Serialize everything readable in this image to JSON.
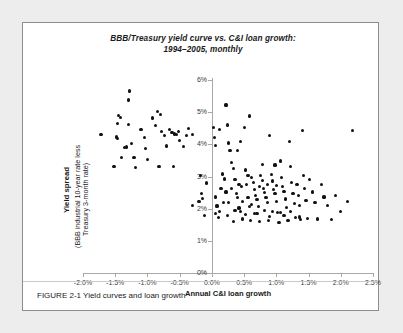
{
  "figure": {
    "caption": "FIGURE 2-1 Yield curves and loan growth"
  },
  "chart_data": {
    "type": "scatter",
    "title": "BBB/Treasury yield curve vs. C&I loan growth:",
    "subtitle": "1994–2005, monthly",
    "xlabel": "Annual C&I loan growth",
    "ylabel_main": "Yield spread",
    "ylabel_sub_line1": "(BBB industrial 10-year rate less",
    "ylabel_sub_line2": "Treasury 3-month rate)",
    "xlim": [
      -2.0,
      2.5
    ],
    "ylim": [
      0,
      6
    ],
    "xticks": [
      -2.0,
      -1.5,
      -1.0,
      -0.5,
      0.0,
      0.5,
      1.0,
      1.5,
      2.0,
      2.5
    ],
    "xticklabels": [
      "-2.0%",
      "-1.5%",
      "-1.0%",
      "-0.5%",
      "0.0%",
      "0.5%",
      "1.0%",
      "1.5%",
      "2.0%",
      "2.5%"
    ],
    "yticks": [
      0,
      1,
      2,
      3,
      4,
      5,
      6
    ],
    "yticklabels": [
      "0%",
      "1%",
      "2%",
      "3%",
      "4%",
      "5%",
      "6%"
    ],
    "grid": false,
    "legend": null,
    "marker_color": "#111111",
    "axis_color": "#a8a8a8",
    "y_axis_position": "x=0.0%",
    "points": [
      [
        -1.72,
        4.3
      ],
      [
        -1.28,
        5.66
      ],
      [
        -1.3,
        5.38
      ],
      [
        -1.45,
        4.9
      ],
      [
        -1.42,
        4.84
      ],
      [
        -1.47,
        4.65
      ],
      [
        -1.3,
        4.62
      ],
      [
        -1.48,
        4.23
      ],
      [
        -1.46,
        4.18
      ],
      [
        -1.35,
        3.9
      ],
      [
        -1.4,
        3.58
      ],
      [
        -1.33,
        3.92
      ],
      [
        -1.25,
        4.02
      ],
      [
        -1.21,
        3.6
      ],
      [
        -1.52,
        3.32
      ],
      [
        -1.1,
        4.47
      ],
      [
        -1.05,
        4.2
      ],
      [
        -1.03,
        3.88
      ],
      [
        -1.0,
        3.54
      ],
      [
        -0.92,
        4.82
      ],
      [
        -0.88,
        4.58
      ],
      [
        -0.85,
        5.02
      ],
      [
        -0.8,
        4.92
      ],
      [
        -0.78,
        4.4
      ],
      [
        -0.74,
        4.27
      ],
      [
        -0.7,
        3.95
      ],
      [
        -0.66,
        4.46
      ],
      [
        -0.62,
        4.38
      ],
      [
        -0.58,
        4.32
      ],
      [
        -0.55,
        4.3
      ],
      [
        -0.52,
        4.4
      ],
      [
        -0.5,
        4.12
      ],
      [
        -0.6,
        3.3
      ],
      [
        -0.82,
        3.3
      ],
      [
        -1.18,
        3.28
      ],
      [
        -0.44,
        3.94
      ],
      [
        -0.4,
        4.28
      ],
      [
        -0.36,
        4.5
      ],
      [
        -0.3,
        4.3
      ],
      [
        -0.18,
        3.02
      ],
      [
        -0.16,
        2.46
      ],
      [
        -0.2,
        2.22
      ],
      [
        -0.3,
        2.1
      ],
      [
        -0.14,
        2.32
      ],
      [
        -0.12,
        1.78
      ],
      [
        -0.08,
        2.8
      ],
      [
        0.02,
        4.52
      ],
      [
        0.04,
        4.22
      ],
      [
        0.06,
        3.96
      ],
      [
        0.05,
        2.36
      ],
      [
        0.08,
        2.08
      ],
      [
        0.1,
        1.72
      ],
      [
        0.12,
        4.45
      ],
      [
        0.14,
        2.62
      ],
      [
        0.18,
        2.2
      ],
      [
        0.22,
        5.22
      ],
      [
        0.24,
        4.6
      ],
      [
        0.26,
        4.04
      ],
      [
        0.28,
        3.82
      ],
      [
        0.3,
        3.44
      ],
      [
        0.2,
        2.92
      ],
      [
        0.22,
        2.52
      ],
      [
        0.26,
        2.18
      ],
      [
        0.34,
        1.6
      ],
      [
        0.36,
        2.9
      ],
      [
        0.38,
        2.46
      ],
      [
        0.4,
        2.34
      ],
      [
        0.42,
        2.02
      ],
      [
        0.46,
        2.68
      ],
      [
        0.48,
        1.68
      ],
      [
        0.5,
        4.52
      ],
      [
        0.52,
        3.2
      ],
      [
        0.54,
        2.74
      ],
      [
        0.56,
        2.34
      ],
      [
        0.58,
        2.06
      ],
      [
        0.6,
        1.62
      ],
      [
        0.62,
        2.98
      ],
      [
        0.64,
        2.82
      ],
      [
        0.66,
        2.6
      ],
      [
        0.68,
        2.42
      ],
      [
        0.7,
        2.28
      ],
      [
        0.72,
        2.06
      ],
      [
        0.74,
        1.6
      ],
      [
        0.76,
        3.02
      ],
      [
        0.78,
        2.88
      ],
      [
        0.8,
        2.62
      ],
      [
        0.82,
        2.5
      ],
      [
        0.84,
        2.34
      ],
      [
        0.86,
        2.18
      ],
      [
        0.88,
        1.62
      ],
      [
        0.9,
        4.28
      ],
      [
        0.92,
        3.06
      ],
      [
        0.94,
        2.86
      ],
      [
        0.96,
        2.6
      ],
      [
        0.98,
        2.46
      ],
      [
        1.0,
        2.22
      ],
      [
        1.02,
        1.88
      ],
      [
        1.04,
        1.58
      ],
      [
        1.06,
        3.48
      ],
      [
        1.08,
        2.96
      ],
      [
        1.1,
        2.68
      ],
      [
        1.12,
        2.54
      ],
      [
        1.14,
        2.3
      ],
      [
        1.16,
        2.04
      ],
      [
        1.18,
        1.62
      ],
      [
        1.2,
        4.08
      ],
      [
        1.22,
        3.3
      ],
      [
        1.24,
        2.82
      ],
      [
        1.26,
        2.48
      ],
      [
        1.28,
        2.16
      ],
      [
        1.3,
        1.72
      ],
      [
        1.32,
        2.74
      ],
      [
        1.34,
        2.4
      ],
      [
        1.36,
        2.1
      ],
      [
        1.38,
        1.66
      ],
      [
        1.4,
        4.42
      ],
      [
        1.42,
        3.02
      ],
      [
        1.44,
        2.62
      ],
      [
        1.46,
        2.26
      ],
      [
        1.48,
        1.7
      ],
      [
        1.52,
        2.9
      ],
      [
        1.56,
        2.52
      ],
      [
        1.6,
        2.18
      ],
      [
        1.64,
        1.68
      ],
      [
        1.7,
        2.74
      ],
      [
        1.74,
        2.36
      ],
      [
        1.8,
        2.1
      ],
      [
        1.86,
        1.66
      ],
      [
        1.92,
        2.42
      ],
      [
        2.0,
        1.92
      ],
      [
        2.1,
        2.22
      ],
      [
        2.18,
        4.42
      ],
      [
        0.44,
        1.9
      ],
      [
        0.52,
        1.82
      ],
      [
        0.66,
        1.86
      ],
      [
        0.82,
        1.94
      ],
      [
        0.94,
        1.9
      ],
      [
        1.06,
        1.88
      ],
      [
        1.22,
        1.92
      ],
      [
        0.3,
        2.62
      ],
      [
        0.34,
        3.26
      ],
      [
        0.4,
        3.8
      ],
      [
        0.44,
        4.1
      ],
      [
        0.58,
        4.88
      ],
      [
        0.16,
        3.08
      ],
      [
        0.12,
        1.92
      ],
      [
        0.06,
        1.86
      ],
      [
        0.74,
        2.7
      ],
      [
        0.86,
        2.74
      ],
      [
        1.0,
        2.72
      ],
      [
        0.62,
        2.12
      ],
      [
        0.48,
        2.22
      ],
      [
        0.7,
        1.84
      ],
      [
        1.12,
        1.78
      ],
      [
        1.36,
        1.74
      ],
      [
        0.98,
        3.36
      ],
      [
        0.78,
        3.38
      ],
      [
        0.9,
        1.76
      ],
      [
        0.56,
        3.02
      ],
      [
        0.42,
        2.76
      ],
      [
        0.36,
        1.94
      ],
      [
        0.24,
        1.78
      ]
    ]
  }
}
